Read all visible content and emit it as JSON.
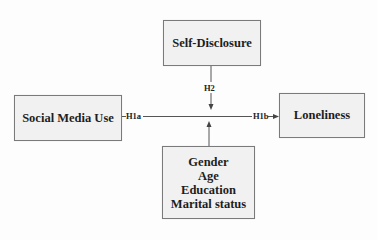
{
  "diagram": {
    "type": "conceptual-model",
    "nodes": {
      "self_disclosure": "Self-Disclosure",
      "social_media_use": "Social Media Use",
      "loneliness": "Loneliness",
      "controls": [
        "Gender",
        "Age",
        "Education",
        "Marital status"
      ]
    },
    "paths": {
      "h1a": "H1a",
      "h1b": "H1b",
      "h2": "H2"
    },
    "edges": [
      {
        "from": "Social Media Use",
        "to": "Loneliness",
        "labels": [
          "H1a",
          "H1b"
        ]
      },
      {
        "from": "Self-Disclosure",
        "to": "Social Media Use → Loneliness path",
        "label": "H2"
      },
      {
        "from": "Controls",
        "to": "Social Media Use → Loneliness path",
        "label": ""
      }
    ],
    "colors": {
      "box_fill": "#f1f1f1",
      "box_border": "#7a7a7a",
      "line": "#555555",
      "text": "#1e1e1e"
    }
  }
}
